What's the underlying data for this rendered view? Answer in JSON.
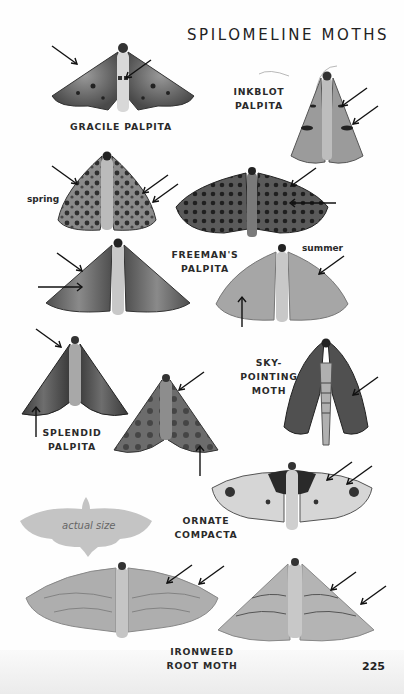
{
  "page": {
    "title": "SPILOMELINE MOTHS",
    "page_number": "225"
  },
  "species": [
    {
      "id": "gracile-palpita",
      "label_line1": "GRACILE PALPITA",
      "label_line2": ""
    },
    {
      "id": "inkblot-palpita",
      "label_line1": "INKBLOT",
      "label_line2": "PALPITA"
    },
    {
      "id": "freemans-palpita",
      "label_line1": "FREEMAN'S",
      "label_line2": "PALPITA"
    },
    {
      "id": "sky-pointing-moth",
      "label_line1": "SKY-POINTING",
      "label_line2": "MOTH"
    },
    {
      "id": "splendid-palpita",
      "label_line1": "SPLENDID",
      "label_line2": "PALPITA"
    },
    {
      "id": "ornate-compacta",
      "label_line1": "ORNATE",
      "label_line2": "COMPACTA"
    },
    {
      "id": "ironweed-root-moth",
      "label_line1": "IRONWEED",
      "label_line2": "ROOT MOTH"
    }
  ],
  "notes": {
    "spring": "spring",
    "summer": "summer",
    "actual_size": "actual size"
  },
  "colors": {
    "text": "#2a2a2a",
    "silhouette": "#c4c4c4",
    "moth_dark": "#3a3a3a",
    "moth_mid": "#7a7a7a",
    "moth_light": "#b8b8b8"
  }
}
